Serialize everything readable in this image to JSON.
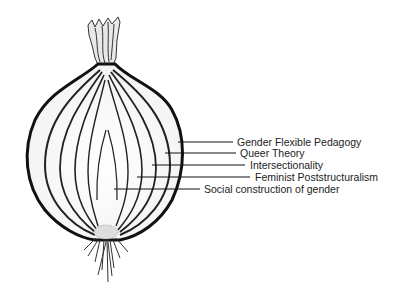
{
  "diagram": {
    "type": "onion-layers",
    "layers": [
      {
        "label": "Gender Flexible Pedagogy",
        "line": {
          "x1": 178,
          "x2": 233,
          "y": 142
        },
        "text_x": 237,
        "text_y": 136
      },
      {
        "label": "Queer Theory",
        "line": {
          "x1": 165,
          "x2": 236,
          "y": 153
        },
        "text_x": 240,
        "text_y": 147
      },
      {
        "label": "Intersectionality",
        "line": {
          "x1": 152,
          "x2": 245,
          "y": 165
        },
        "text_x": 250,
        "text_y": 159
      },
      {
        "label": "Feminist Poststructuralism",
        "line": {
          "x1": 137,
          "x2": 250,
          "y": 177
        },
        "text_x": 255,
        "text_y": 171
      },
      {
        "label": "Social construction of gender",
        "line": {
          "x1": 114,
          "x2": 200,
          "y": 189
        },
        "text_x": 204,
        "text_y": 183
      }
    ]
  }
}
